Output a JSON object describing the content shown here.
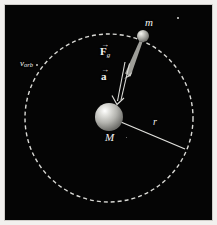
{
  "figure": {
    "background_color": "#050505",
    "border_color": "#cfcdc9",
    "canvas": {
      "width": 217,
      "height": 225
    }
  },
  "labels": {
    "central_mass": "M",
    "orbiting_mass": "m",
    "radius": "r",
    "orbital_velocity_symbol": "v",
    "orbital_velocity_subscript": "orb",
    "force_symbol": "F",
    "force_subscript": "g",
    "acceleration_symbol": "a",
    "vector_overbar": "→"
  },
  "diagram_data": {
    "type": "physics-orbit-diagram",
    "orbit": {
      "shape": "circle",
      "style": "dashed",
      "color": "#e6e6e2",
      "center": {
        "x": 104,
        "y": 113
      },
      "radius": 84,
      "dash_pattern": "4 3"
    },
    "bodies": [
      {
        "name": "central-mass",
        "label": "M",
        "center": {
          "x": 104,
          "y": 112
        },
        "radius": 14,
        "color": "#b9b9b4",
        "highlight_color": "#f0f0ec"
      },
      {
        "name": "orbiting-mass",
        "label": "m",
        "center": {
          "x": 138,
          "y": 31
        },
        "radius": 6,
        "color": "#a9a9a4",
        "highlight_color": "#e4e4e0"
      }
    ],
    "vectors": [
      {
        "name": "gravitational-force",
        "label": "F",
        "subscript": "g",
        "style": "solid-tapered",
        "from": {
          "x": 137,
          "y": 38
        },
        "to": {
          "x": 122,
          "y": 70
        },
        "color": "#b5b5b0"
      },
      {
        "name": "acceleration",
        "label": "a",
        "subscript": "",
        "style": "outline-double",
        "from": {
          "x": 119,
          "y": 58
        },
        "to": {
          "x": 113,
          "y": 97
        },
        "color": "#d8d8d4"
      }
    ],
    "radius_line": {
      "name": "radius-line",
      "from": {
        "x": 104,
        "y": 112
      },
      "to": {
        "x": 180,
        "y": 144
      },
      "color": "#e2e2de",
      "label": "r"
    },
    "velocity_marker": {
      "name": "orbital-velocity-marker",
      "at": {
        "x": 31,
        "y": 59
      },
      "label": "v_orb"
    },
    "stars": [
      {
        "x": 172,
        "y": 12,
        "size": 1.6
      },
      {
        "x": 121,
        "y": 132,
        "size": 1.2
      },
      {
        "x": 31,
        "y": 59,
        "size": 1.6
      }
    ]
  }
}
